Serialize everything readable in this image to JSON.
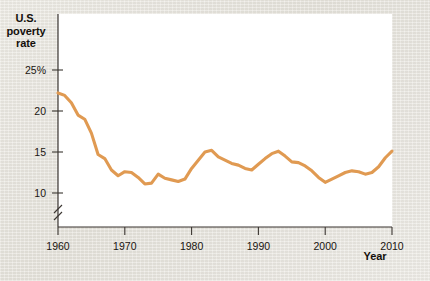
{
  "figure": {
    "background_color": "#e6e3dc",
    "panel_color": "#ffffff",
    "line_color": "#e09a52",
    "axis_color": "#3a3531",
    "text_color": "#14100c"
  },
  "labels": {
    "y_axis_title": "U.S.\npoverty\nrate",
    "y_axis_title_line1": "U.S.",
    "y_axis_title_line2": "poverty",
    "y_axis_title_line3": "rate",
    "x_axis_title": "Year"
  },
  "axis_break": {
    "present": true,
    "symbol": "double-slash",
    "location": "y-axis below 10"
  },
  "chart_data": {
    "type": "line",
    "title": "",
    "subtitle": "",
    "xlabel": "Year",
    "ylabel": "U.S. poverty rate",
    "xlim": [
      1959,
      2010
    ],
    "ylim": [
      9.0,
      25.0
    ],
    "xticks": [
      1960,
      1970,
      1980,
      1990,
      2000,
      2010
    ],
    "xtick_labels": [
      "1960",
      "1970",
      "1980",
      "1990",
      "2000",
      "2010"
    ],
    "yticks": [
      10,
      15,
      20,
      25
    ],
    "ytick_labels": [
      "10",
      "15",
      "20",
      "25%"
    ],
    "grid": false,
    "legend": "none",
    "series": [
      {
        "name": "U.S. poverty rate",
        "color": "#e09a52",
        "x": [
          1960,
          1961,
          1962,
          1963,
          1964,
          1965,
          1966,
          1967,
          1968,
          1969,
          1970,
          1971,
          1972,
          1973,
          1974,
          1975,
          1976,
          1977,
          1978,
          1979,
          1980,
          1981,
          1982,
          1983,
          1984,
          1985,
          1986,
          1987,
          1988,
          1989,
          1990,
          1991,
          1992,
          1993,
          1994,
          1995,
          1996,
          1997,
          1998,
          1999,
          2000,
          2001,
          2002,
          2003,
          2004,
          2005,
          2006,
          2007,
          2008,
          2009,
          2010
        ],
        "values": [
          22.2,
          21.9,
          21.0,
          19.5,
          19.0,
          17.3,
          14.7,
          14.2,
          12.8,
          12.1,
          12.6,
          12.5,
          11.9,
          11.1,
          11.2,
          12.3,
          11.8,
          11.6,
          11.4,
          11.7,
          13.0,
          14.0,
          15.0,
          15.2,
          14.4,
          14.0,
          13.6,
          13.4,
          13.0,
          12.8,
          13.5,
          14.2,
          14.8,
          15.1,
          14.5,
          13.8,
          13.7,
          13.3,
          12.7,
          11.9,
          11.3,
          11.7,
          12.1,
          12.5,
          12.7,
          12.6,
          12.3,
          12.5,
          13.2,
          14.3,
          15.1
        ]
      }
    ]
  }
}
